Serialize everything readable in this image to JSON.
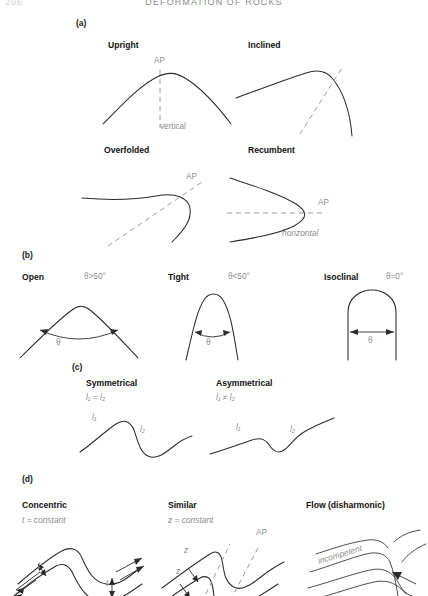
{
  "header": {
    "folio": "206",
    "running_head": "DEFORMATION OF ROCKS"
  },
  "panels": [
    {
      "letter": "(a)",
      "items": [
        {
          "title": "Upright",
          "ap_label": "AP",
          "annotation": "vertical"
        },
        {
          "title": "Inclined",
          "ap_label": "",
          "annotation": ""
        },
        {
          "title": "Overfolded",
          "ap_label": "AP",
          "annotation": ""
        },
        {
          "title": "Recumbent",
          "ap_label": "AP",
          "annotation": "horizontal"
        }
      ]
    },
    {
      "letter": "(b)",
      "items": [
        {
          "title": "Open",
          "condition": "θ>50°",
          "angle_symbol": "θ"
        },
        {
          "title": "Tight",
          "condition": "θ<50°",
          "angle_symbol": "θ"
        },
        {
          "title": "Isoclinal",
          "condition": "θ=0°",
          "angle_symbol": "θ"
        }
      ]
    },
    {
      "letter": "(c)",
      "items": [
        {
          "title": "Symmetrical",
          "condition": "l₁ = l₂",
          "limb_labels": [
            "l₁",
            "l₂"
          ]
        },
        {
          "title": "Asymmetrical",
          "condition": "l₁ ≠ l₂",
          "limb_labels": [
            "l₁",
            "l₂"
          ]
        }
      ]
    },
    {
      "letter": "(d)",
      "items": [
        {
          "title": "Concentric",
          "condition": "t = constant",
          "measure_labels": [
            "t",
            "t"
          ]
        },
        {
          "title": "Similar",
          "condition": "z = constant",
          "measure_labels": [
            "z",
            "z"
          ],
          "ap_label": "AP"
        },
        {
          "title": "Flow (disharmonic)",
          "condition": "",
          "layer_label": "incompetent"
        }
      ]
    }
  ],
  "colors": {
    "ink": "#2b2b2b",
    "annotation": "#8d8d8d",
    "dashed_axial_plane": "#9c9c9c",
    "background": "#ffffff"
  }
}
